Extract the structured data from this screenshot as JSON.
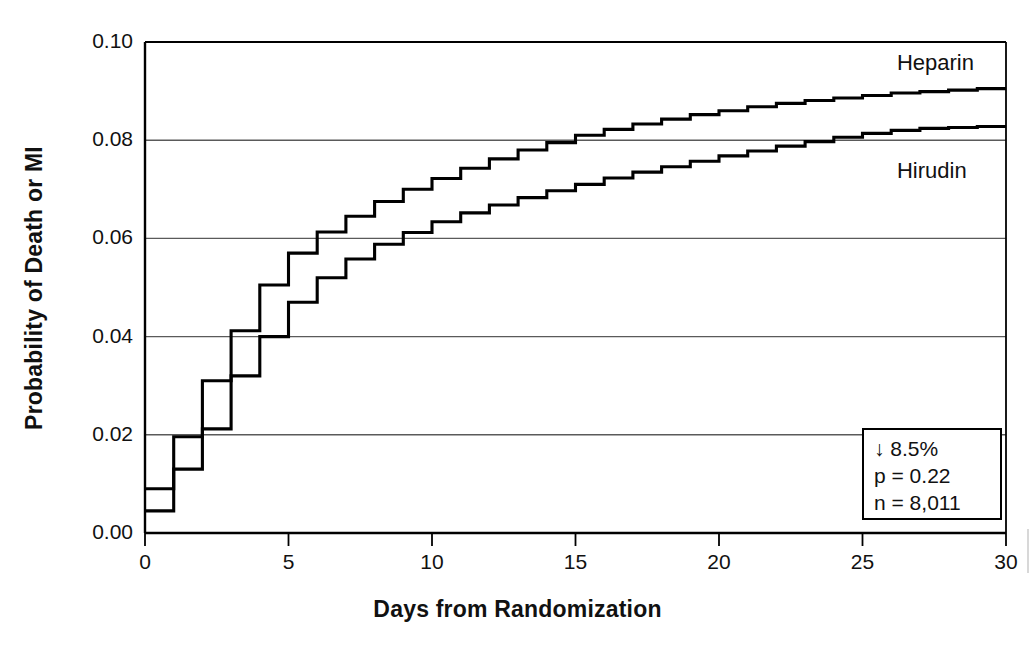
{
  "chart_data": {
    "type": "line",
    "subtype": "kaplan-meier-step",
    "title": "",
    "xlabel": "Days from Randomization",
    "ylabel": "Probability of Death or MI",
    "xlim": [
      0,
      30
    ],
    "ylim": [
      0.0,
      0.1
    ],
    "xticks": [
      "0",
      "5",
      "10",
      "15",
      "20",
      "25",
      "30"
    ],
    "xtick_values": [
      0,
      5,
      10,
      15,
      20,
      25,
      30
    ],
    "yticks": [
      "0.00",
      "0.02",
      "0.04",
      "0.06",
      "0.08",
      "0.10"
    ],
    "ytick_values": [
      0.0,
      0.02,
      0.04,
      0.06,
      0.08,
      0.1
    ],
    "grid": "horizontal",
    "legend_position": "inline-curve-labels",
    "series": [
      {
        "name": "Heparin",
        "label_x": 26.2,
        "label_y": 0.0955,
        "x": [
          0,
          1,
          1,
          2,
          2,
          3,
          3,
          4,
          4,
          5,
          5,
          6,
          6,
          7,
          7,
          8,
          8,
          9,
          9,
          10,
          10,
          11,
          11,
          12,
          12,
          13,
          13,
          14,
          14,
          15,
          15,
          16,
          16,
          17,
          17,
          18,
          18,
          19,
          19,
          20,
          20,
          21,
          21,
          22,
          22,
          23,
          23,
          24,
          24,
          25,
          25,
          26,
          26,
          27,
          27,
          28,
          28,
          29,
          29,
          30
        ],
        "y": [
          0.009,
          0.009,
          0.0196,
          0.0196,
          0.031,
          0.031,
          0.0412,
          0.0412,
          0.0505,
          0.0505,
          0.057,
          0.057,
          0.0613,
          0.0613,
          0.0645,
          0.0645,
          0.0675,
          0.0675,
          0.07,
          0.07,
          0.0722,
          0.0722,
          0.0743,
          0.0743,
          0.0762,
          0.0762,
          0.078,
          0.078,
          0.0795,
          0.0795,
          0.081,
          0.081,
          0.0822,
          0.0822,
          0.0833,
          0.0833,
          0.0843,
          0.0843,
          0.0852,
          0.0852,
          0.086,
          0.086,
          0.0868,
          0.0868,
          0.0875,
          0.0875,
          0.0881,
          0.0881,
          0.0886,
          0.0886,
          0.0891,
          0.0891,
          0.0896,
          0.0896,
          0.0899,
          0.0899,
          0.0902,
          0.0902,
          0.0905,
          0.0905
        ]
      },
      {
        "name": "Hirudin",
        "label_x": 26.2,
        "label_y": 0.0735,
        "x": [
          0,
          1,
          1,
          2,
          2,
          3,
          3,
          4,
          4,
          5,
          5,
          6,
          6,
          7,
          7,
          8,
          8,
          9,
          9,
          10,
          10,
          11,
          11,
          12,
          12,
          13,
          13,
          14,
          14,
          15,
          15,
          16,
          16,
          17,
          17,
          18,
          18,
          19,
          19,
          20,
          20,
          21,
          21,
          22,
          22,
          23,
          23,
          24,
          24,
          25,
          25,
          26,
          26,
          27,
          27,
          28,
          28,
          29,
          29,
          30
        ],
        "y": [
          0.0045,
          0.0045,
          0.013,
          0.013,
          0.0212,
          0.0212,
          0.032,
          0.032,
          0.04,
          0.04,
          0.047,
          0.047,
          0.052,
          0.052,
          0.0558,
          0.0558,
          0.0588,
          0.0588,
          0.0612,
          0.0612,
          0.0634,
          0.0634,
          0.0652,
          0.0652,
          0.0668,
          0.0668,
          0.0683,
          0.0683,
          0.0697,
          0.0697,
          0.071,
          0.071,
          0.0723,
          0.0723,
          0.0735,
          0.0735,
          0.0746,
          0.0746,
          0.0757,
          0.0757,
          0.0768,
          0.0768,
          0.0778,
          0.0778,
          0.0788,
          0.0788,
          0.0797,
          0.0797,
          0.0806,
          0.0806,
          0.0814,
          0.0814,
          0.082,
          0.082,
          0.0824,
          0.0824,
          0.0826,
          0.0826,
          0.0828,
          0.0828
        ]
      }
    ],
    "annotations": {
      "reduction": "↓ 8.5%",
      "p_value": "p = 0.22",
      "n": "n = 8,011"
    },
    "colors": {
      "line": "#000000",
      "grid": "#5a5a5a",
      "axis": "#000000",
      "background": "#ffffff"
    }
  },
  "axes": {
    "x_title": "Days from Randomization",
    "y_title": "Probability of Death or MI",
    "x_tick_labels": [
      "0",
      "5",
      "10",
      "15",
      "20",
      "25",
      "30"
    ],
    "y_tick_labels": [
      "0.00",
      "0.02",
      "0.04",
      "0.06",
      "0.08",
      "0.10"
    ]
  },
  "series_labels": {
    "upper": "Heparin",
    "lower": "Hirudin"
  },
  "stats_box": {
    "line1": "↓ 8.5%",
    "line2": "p = 0.22",
    "line3": "n = 8,011"
  }
}
